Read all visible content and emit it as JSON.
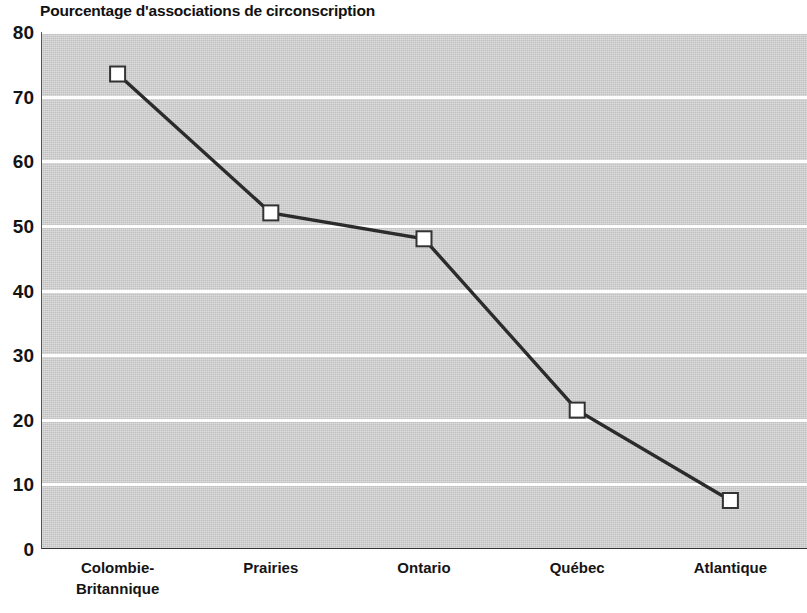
{
  "chart_data": {
    "type": "line",
    "title": "Pourcentage d'associations de circonscription",
    "subtitle": "",
    "xlabel": "",
    "ylabel": "",
    "categories": [
      "Colombie-Britannique",
      "Prairies",
      "Ontario",
      "Québec",
      "Atlantique"
    ],
    "category_lines": [
      [
        "Colombie-",
        "Britannique"
      ],
      [
        "Prairies"
      ],
      [
        "Ontario"
      ],
      [
        "Québec"
      ],
      [
        "Atlantique"
      ]
    ],
    "values": [
      73.5,
      52,
      48,
      21.5,
      7.5
    ],
    "series": [
      {
        "name": "Pourcentage d'associations de circonscription",
        "values": [
          73.5,
          52,
          48,
          21.5,
          7.5
        ]
      }
    ],
    "ylim": [
      0,
      80
    ],
    "yticks": [
      0,
      10,
      20,
      30,
      40,
      50,
      60,
      70,
      80
    ],
    "ytick_labels": [
      "0",
      "10",
      "20",
      "30",
      "40",
      "50",
      "60",
      "70",
      "80"
    ],
    "grid": true,
    "grid_axis": "y",
    "grid_color": "#fdfdfd",
    "legend": false,
    "legend_position": "none",
    "marker": "square",
    "marker_facecolor": "#ffffff",
    "marker_edgecolor": "#333333",
    "line_color": "#2b2b2b",
    "plot_bgcolor": "#d2d2d2",
    "figure_bgcolor": "#ffffff"
  }
}
